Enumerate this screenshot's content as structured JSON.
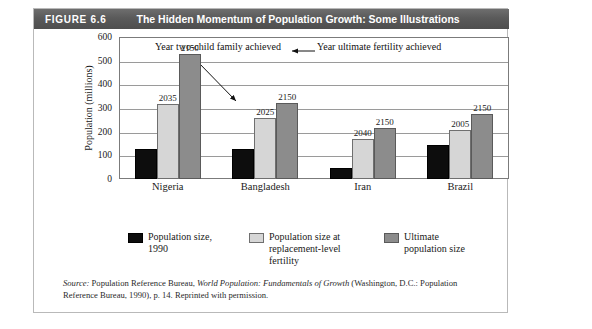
{
  "figure": {
    "number": "FIGURE 6.6",
    "title": "The Hidden Momentum of Population Growth: Some Illustrations"
  },
  "annotations": {
    "two_child": "Year two-child family\nachieved",
    "ultimate": "Year ultimate fertility\nachieved"
  },
  "legend": {
    "items": [
      {
        "label": "Population size,\n1990",
        "color": "#0d0d0d",
        "swatch": "black"
      },
      {
        "label": "Population size at\nreplacement-level\nfertility",
        "color": "#d6d6d6",
        "swatch": "light"
      },
      {
        "label": "Ultimate\npopulation size",
        "color": "#8c8c8c",
        "swatch": "dark"
      }
    ]
  },
  "source": {
    "lead": "Source:",
    "text_1": " Population Reference Bureau, ",
    "italic_1": "World Population: Fundamentals of Growth",
    "text_2": " (Washington, D.C.: Population Reference Bureau, 1990), p. 14. Reprinted with permission."
  },
  "chart_data": {
    "type": "bar",
    "title": "The Hidden Momentum of Population Growth: Some Illustrations",
    "xlabel": "",
    "ylabel": "Population (millions)",
    "ylim": [
      0,
      600
    ],
    "yticks": [
      0,
      100,
      200,
      300,
      400,
      500,
      600
    ],
    "grid": true,
    "legend_position": "bottom",
    "categories": [
      "Nigeria",
      "Bangladesh",
      "Iran",
      "Brazil"
    ],
    "series": [
      {
        "name": "Population size, 1990",
        "color": "#0d0d0d",
        "values": [
          125,
          125,
          45,
          145
        ],
        "labels": [
          "",
          "",
          "",
          ""
        ]
      },
      {
        "name": "Population size at replacement-level fertility",
        "color": "#d6d6d6",
        "values": [
          315,
          257,
          170,
          205
        ],
        "labels": [
          "2035",
          "2025",
          "2040",
          "2005"
        ]
      },
      {
        "name": "Ultimate population size",
        "color": "#8c8c8c",
        "values": [
          530,
          320,
          215,
          275
        ],
        "labels": [
          "2150",
          "2150",
          "2150",
          "2150"
        ]
      }
    ]
  }
}
